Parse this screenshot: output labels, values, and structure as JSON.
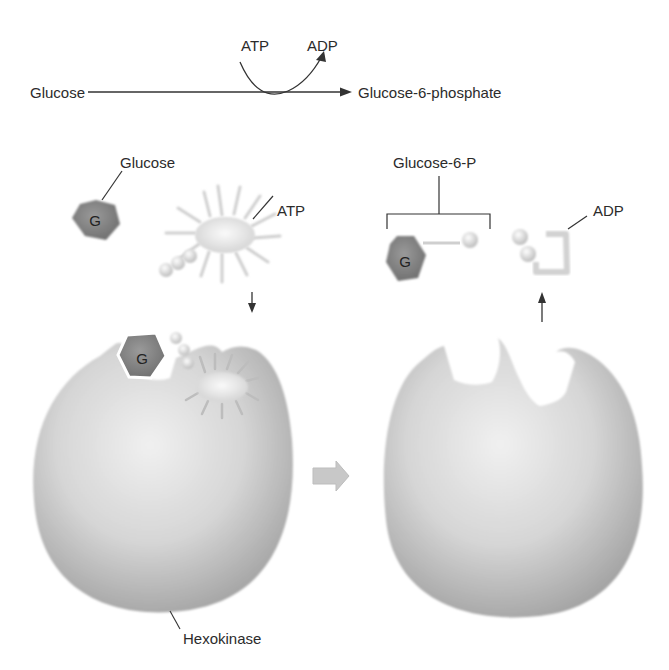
{
  "reaction": {
    "substrate": "Glucose",
    "product": "Glucose-6-phosphate",
    "cofactor_in": "ATP",
    "cofactor_out": "ADP"
  },
  "before_panel": {
    "glucose_label": "Glucose",
    "glucose_symbol": "G",
    "atp_label": "ATP",
    "bound_glucose_symbol": "G",
    "enzyme_label": "Hexokinase"
  },
  "after_panel": {
    "product_label": "Glucose-6-P",
    "product_symbol": "G",
    "adp_label": "ADP"
  },
  "colors": {
    "text": "#2b2b2b",
    "line": "#333333",
    "hexagon": "#8a8a8a",
    "enzyme_light": "#e6e6e6",
    "enzyme_dark": "#a8a8a8",
    "transition_arrow": "#c8c8c8"
  }
}
